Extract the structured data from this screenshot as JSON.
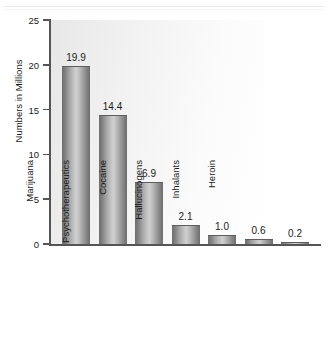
{
  "chart_data": {
    "type": "bar",
    "title": "",
    "subtitle": "",
    "xlabel": "",
    "ylabel": "Numbers in Millions",
    "categories": [
      "Illicit Drugs",
      "Marijuana",
      "Psychotherapeutics",
      "Cocaine",
      "Hallucinogens",
      "Inhalants",
      "Heroin"
    ],
    "category_footnotes": [
      "1",
      "",
      "",
      "",
      "",
      "",
      ""
    ],
    "values": [
      19.9,
      14.4,
      6.9,
      2.1,
      1.0,
      0.6,
      0.2
    ],
    "value_labels": [
      "19.9",
      "14.4",
      "6.9",
      "2.1",
      "1.0",
      "0.6",
      "0.2"
    ],
    "ylim": [
      0,
      25
    ],
    "yticks": [
      0,
      5,
      10,
      15,
      20,
      25
    ],
    "ytick_labels": [
      "0",
      "5",
      "10",
      "15",
      "20",
      "25"
    ],
    "grid": false,
    "legend": null,
    "legend_position": "none",
    "colors": {
      "bar_edge": "#6e6e6e",
      "bar_center": "#cfcfcf",
      "axis": "#555555",
      "text": "#1a1a1a",
      "plot_background": "#f2f2f2",
      "figure_background": "#ffffff"
    }
  }
}
